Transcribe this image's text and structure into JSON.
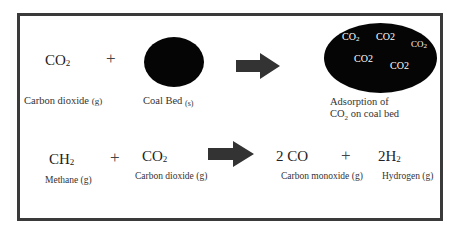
{
  "diagram": {
    "reaction1": {
      "reactant1": {
        "formula": "CO",
        "subscript": "2",
        "label": "Carbon dioxide",
        "state": "(g)"
      },
      "operator": "+",
      "reactant2": {
        "shape": "black-circle",
        "label": "Coal Bed",
        "state": "(s)"
      },
      "arrow": "right-arrow",
      "product": {
        "shape": "black-ellipse",
        "inner_molecules": [
          "CO2",
          "CO2",
          "CO2",
          "CO2",
          "CO2"
        ],
        "label_line1": "Adsorption of",
        "label_line2": "CO2 on coal bed"
      }
    },
    "reaction2": {
      "reactant1": {
        "formula": "CH",
        "subscript": "4",
        "label": "Methane (g)"
      },
      "operator1": "+",
      "reactant2": {
        "formula": "CO",
        "subscript": "2",
        "label": "Carbon dioxide (g)"
      },
      "arrow": "right-arrow",
      "product1": {
        "formula": "2 CO",
        "label": "Carbon monoxide (g)"
      },
      "operator2": "+",
      "product2": {
        "formula": "2H",
        "subscript": "2",
        "label": "Hydrogen (g)"
      }
    },
    "colors": {
      "border": "#3a3a3a",
      "fill": "#050505",
      "arrow": "#333333"
    }
  }
}
